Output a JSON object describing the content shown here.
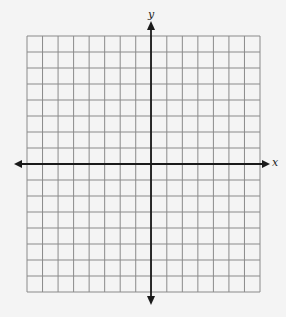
{
  "graph": {
    "x_axis_label": "x",
    "y_axis_label": "y",
    "columns": 15,
    "rows": 16,
    "columns_left_of_y_axis": 8,
    "rows_above_x_axis": 8,
    "colors": {
      "background": "#f4f4f4",
      "grid": "#8a8a8a",
      "axis": "#1a1a1a"
    }
  }
}
